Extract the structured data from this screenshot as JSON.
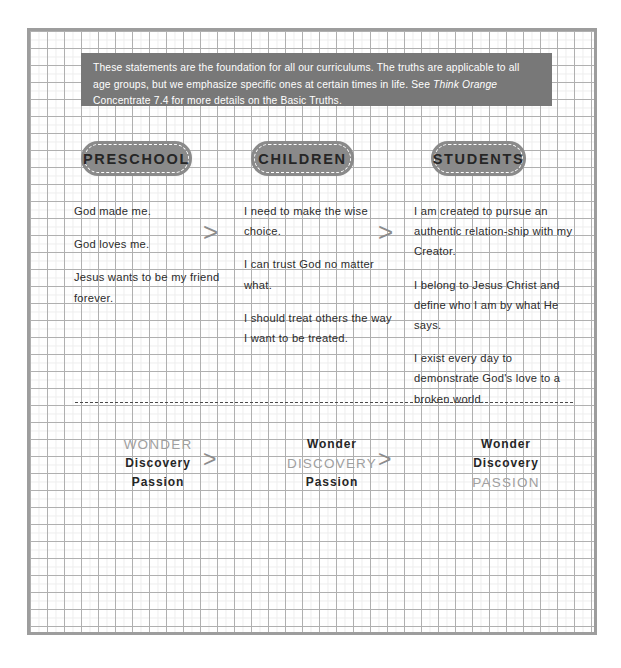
{
  "intro": {
    "text_before_italic": "These statements are the foundation for all our curriculums. The truths are applicable to all age groups, but we emphasize specific ones at certain times in life. See ",
    "italic_title": "Think Orange",
    "text_after_italic": " Concentrate 7.4 for more details on the Basic Truths."
  },
  "columns": [
    {
      "pill_label": "PRESCHOOL",
      "statements": [
        "God made me.",
        "God loves me.",
        "Jesus wants to be my friend forever."
      ]
    },
    {
      "pill_label": "CHILDREN",
      "statements": [
        "I need to make the wise choice.",
        "I can trust God no matter what.",
        "I should treat others the way I want to be treated."
      ]
    },
    {
      "pill_label": "STUDENTS",
      "statements": [
        "I am created to pursue an authentic relation-ship with my Creator.",
        "I belong to Jesus Christ and define who I am by what He says.",
        "I exist every day to demonstrate God's love to a broken world."
      ]
    }
  ],
  "arrows": {
    "glyph": ">",
    "count_top": 2,
    "count_bottom": 2
  },
  "triads": [
    {
      "words": [
        {
          "text": "WONDER",
          "emphasized": true
        },
        {
          "text": "Discovery",
          "emphasized": false
        },
        {
          "text": "Passion",
          "emphasized": false
        }
      ]
    },
    {
      "words": [
        {
          "text": "Wonder",
          "emphasized": false
        },
        {
          "text": "DISCOVERY",
          "emphasized": true
        },
        {
          "text": "Passion",
          "emphasized": false
        }
      ]
    },
    {
      "words": [
        {
          "text": "Wonder",
          "emphasized": false
        },
        {
          "text": "Discovery",
          "emphasized": false
        },
        {
          "text": "PASSION",
          "emphasized": true
        }
      ]
    }
  ],
  "colors": {
    "callout_background": "#787878",
    "pill_background": "#8a8a8a",
    "pill_text": "#262626",
    "body_text": "#2b2b2b",
    "emphasized_word": "#a0a0a0",
    "arrow": "#8c8c8c",
    "grid_major": "#b0b0b0",
    "grid_minor": "#ededed",
    "page_border": "#9d9d9d"
  }
}
